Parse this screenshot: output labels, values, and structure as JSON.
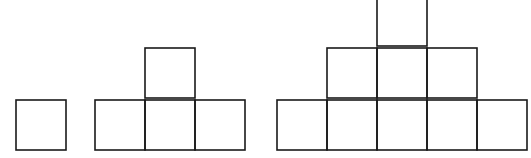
{
  "diagram": {
    "type": "square-pattern-sequence",
    "stroke_color": "#1a1a1a",
    "background": "#ffffff",
    "cell_size": 50,
    "figures": [
      {
        "name": "figure-1",
        "cells": [
          [
            16,
            100
          ]
        ]
      },
      {
        "name": "figure-2",
        "cells": [
          [
            95,
            100
          ],
          [
            145,
            100
          ],
          [
            195,
            100
          ],
          [
            145,
            48
          ]
        ]
      },
      {
        "name": "figure-3",
        "cells": [
          [
            277,
            100
          ],
          [
            327,
            100
          ],
          [
            377,
            100
          ],
          [
            427,
            100
          ],
          [
            477,
            100
          ],
          [
            327,
            48
          ],
          [
            377,
            48
          ],
          [
            427,
            48
          ],
          [
            377,
            -4
          ]
        ]
      }
    ]
  }
}
